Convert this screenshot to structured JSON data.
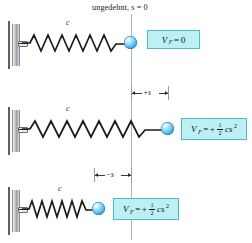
{
  "figure": {
    "caption": "ungedehnt, s = 0",
    "reference_line_x": 131,
    "rows": [
      {
        "id": "row-unstretched",
        "spring_label": "c",
        "dimension_label": "",
        "state": "unstretched",
        "formula": {
          "variable": "V",
          "subscript": "F",
          "equals": "=",
          "value": "0",
          "sign": "",
          "fraction_num": "",
          "fraction_den": "",
          "term": "",
          "exponent": ""
        }
      },
      {
        "id": "row-stretched",
        "spring_label": "c",
        "dimension_label": "+s",
        "state": "stretched",
        "formula": {
          "variable": "V",
          "subscript": "F",
          "equals": "=",
          "value": "",
          "sign": "+",
          "fraction_num": "1",
          "fraction_den": "2",
          "term": "cs",
          "exponent": "2"
        }
      },
      {
        "id": "row-compressed",
        "spring_label": "c",
        "dimension_label": "−s",
        "state": "compressed",
        "formula": {
          "variable": "V",
          "subscript": "F",
          "equals": "=",
          "value": "",
          "sign": "+",
          "fraction_num": "1",
          "fraction_den": "2",
          "term": "cs",
          "exponent": "2"
        }
      }
    ],
    "colors": {
      "box_fill": "#bdf0f4",
      "box_border": "#4fb9c4",
      "ball": "#5cc2ef",
      "wall": "#9a9aa2",
      "reference_line": "#b4b4b4",
      "spring": "#1a1a1a"
    }
  }
}
